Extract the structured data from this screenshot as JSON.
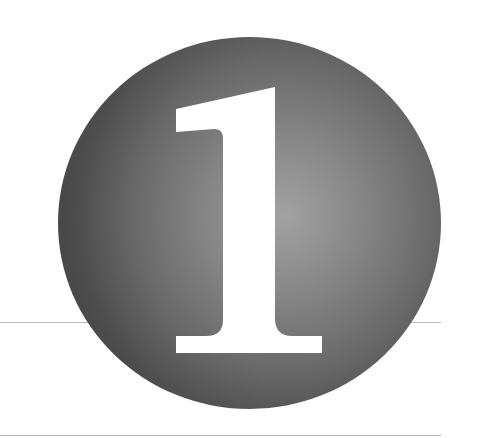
{
  "chapter": {
    "number": "1",
    "label": "Chapter number badge"
  },
  "colors": {
    "badge_edge": "#464646",
    "badge_highlight": "#a2a2a2",
    "numeral": "#ffffff",
    "rules": "#b9b9b9",
    "background": "#ffffff"
  }
}
